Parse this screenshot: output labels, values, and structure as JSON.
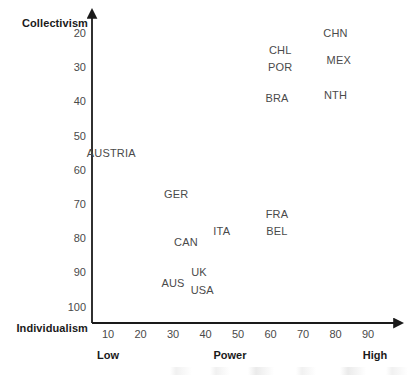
{
  "chart_data": {
    "type": "scatter",
    "title": "",
    "xlabel": "Power",
    "ylabel": "",
    "y_axis_top_label": "Collectivism",
    "y_axis_bottom_label": "Individualism",
    "x_low_label": "Low",
    "x_high_label": "High",
    "xlim": [
      5,
      95
    ],
    "ylim": [
      15,
      105
    ],
    "y_inverted": true,
    "grid": false,
    "legend": "none",
    "xticks": [
      10,
      20,
      30,
      40,
      50,
      60,
      70,
      80,
      90
    ],
    "yticks": [
      20,
      30,
      40,
      50,
      60,
      70,
      80,
      90,
      100
    ],
    "point_style": "text-label-only",
    "points": [
      {
        "label": "CHN",
        "x": 80,
        "y": 20
      },
      {
        "label": "CHL",
        "x": 63,
        "y": 25
      },
      {
        "label": "MEX",
        "x": 81,
        "y": 28
      },
      {
        "label": "POR",
        "x": 63,
        "y": 30
      },
      {
        "label": "NTH",
        "x": 80,
        "y": 38
      },
      {
        "label": "BRA",
        "x": 62,
        "y": 39
      },
      {
        "label": "AUSTRIA",
        "x": 11,
        "y": 55
      },
      {
        "label": "GER",
        "x": 31,
        "y": 67
      },
      {
        "label": "FRA",
        "x": 62,
        "y": 73
      },
      {
        "label": "ITA",
        "x": 45,
        "y": 78
      },
      {
        "label": "BEL",
        "x": 62,
        "y": 78
      },
      {
        "label": "CAN",
        "x": 34,
        "y": 81
      },
      {
        "label": "UK",
        "x": 38,
        "y": 90
      },
      {
        "label": "AUS",
        "x": 30,
        "y": 93
      },
      {
        "label": "USA",
        "x": 39,
        "y": 95
      }
    ]
  },
  "colors": {
    "axis": "#1a1a1a",
    "tick_text": "#4a4a4a",
    "label_text": "#4a4a4a",
    "title_text": "#1a1a1a",
    "background": "#ffffff"
  }
}
